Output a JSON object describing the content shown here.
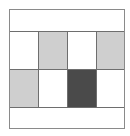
{
  "diagram": {
    "type": "grid",
    "rows": 2,
    "columns": 4,
    "has_top_band": true,
    "has_bottom_band": true,
    "colors": {
      "white": "#ffffff",
      "light_gray": "#cfcfcf",
      "dark_gray": "#4a4a4a",
      "border": "#6e6e6e",
      "frame_border": "#8a8a8a"
    },
    "cells": [
      [
        {
          "fill": "#ffffff",
          "shade": "white"
        },
        {
          "fill": "#cfcfcf",
          "shade": "light-gray"
        },
        {
          "fill": "#ffffff",
          "shade": "white"
        },
        {
          "fill": "#cfcfcf",
          "shade": "light-gray"
        }
      ],
      [
        {
          "fill": "#cfcfcf",
          "shade": "light-gray"
        },
        {
          "fill": "#ffffff",
          "shade": "white"
        },
        {
          "fill": "#4a4a4a",
          "shade": "dark-gray"
        },
        {
          "fill": "#ffffff",
          "shade": "white"
        }
      ]
    ]
  }
}
